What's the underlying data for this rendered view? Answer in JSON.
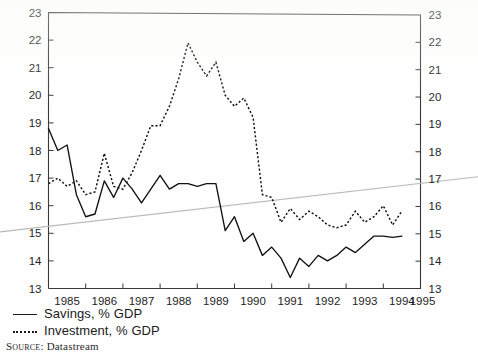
{
  "figure": {
    "kind": "scanned-line-chart",
    "background_color": "#fefefe",
    "ink_color": "#111111"
  },
  "legend": {
    "position": "below-axis-left",
    "items": [
      {
        "style": "solid",
        "label": "Savings, % GDP",
        "icon": "solid-line-swatch"
      },
      {
        "style": "dotted",
        "label": "Investment, % GDP",
        "icon": "dotted-line-swatch"
      }
    ]
  },
  "source": {
    "key": "Source:",
    "value": "Datastream"
  },
  "chart_data": {
    "type": "line",
    "title": "",
    "subtitle": "",
    "xlabel": "",
    "ylabel": "",
    "ylabel_right": "",
    "grid": false,
    "legend_position": "below",
    "xlim": [
      1985.0,
      1995.0
    ],
    "ylim": [
      13,
      23
    ],
    "yticks": [
      13,
      14,
      15,
      16,
      17,
      18,
      19,
      20,
      21,
      22,
      23
    ],
    "ytick_labels": [
      "13",
      "14",
      "15",
      "16",
      "17",
      "18",
      "19",
      "20",
      "21",
      "22",
      "23"
    ],
    "y_axis_both_sides": true,
    "xticks": [
      1985,
      1986,
      1987,
      1988,
      1989,
      1990,
      1991,
      1992,
      1993,
      1994,
      1995
    ],
    "xtick_labels": [
      "1985",
      "1986",
      "1987",
      "1988",
      "1989",
      "1990",
      "1991",
      "1992",
      "1993",
      "1994",
      "1995"
    ],
    "x_tick_label_placement": "between-ticks",
    "frequency": "quarterly",
    "x": [
      1985.0,
      1985.25,
      1985.5,
      1985.75,
      1986.0,
      1986.25,
      1986.5,
      1986.75,
      1987.0,
      1987.25,
      1987.5,
      1987.75,
      1988.0,
      1988.25,
      1988.5,
      1988.75,
      1989.0,
      1989.25,
      1989.5,
      1989.75,
      1990.0,
      1990.25,
      1990.5,
      1990.75,
      1991.0,
      1991.25,
      1991.5,
      1991.75,
      1992.0,
      1992.25,
      1992.5,
      1992.75,
      1993.0,
      1993.25,
      1993.5,
      1993.75,
      1994.0,
      1994.25,
      1994.5
    ],
    "series": [
      {
        "name": "Savings, % GDP",
        "style": "solid",
        "color": "#111111",
        "values": [
          18.8,
          18.0,
          18.2,
          16.4,
          15.6,
          15.7,
          16.9,
          16.3,
          17.0,
          16.6,
          16.1,
          16.6,
          17.1,
          16.6,
          16.8,
          16.8,
          16.7,
          16.8,
          16.8,
          15.1,
          15.6,
          14.7,
          15.0,
          14.2,
          14.5,
          14.1,
          13.4,
          14.1,
          13.8,
          14.2,
          14.0,
          14.2,
          14.5,
          14.3,
          14.6,
          14.9,
          14.9,
          14.85,
          14.9
        ]
      },
      {
        "name": "Investment, % GDP",
        "style": "dotted",
        "color": "#111111",
        "values": [
          16.8,
          17.0,
          16.7,
          16.9,
          16.4,
          16.5,
          17.9,
          16.7,
          16.6,
          17.2,
          18.0,
          18.9,
          18.9,
          19.6,
          20.6,
          21.9,
          21.2,
          20.7,
          21.2,
          20.0,
          19.6,
          19.9,
          19.2,
          16.4,
          16.3,
          15.4,
          15.9,
          15.5,
          15.8,
          15.6,
          15.3,
          15.2,
          15.3,
          15.8,
          15.4,
          15.6,
          16.0,
          15.3,
          15.8
        ]
      }
    ],
    "annotations": [
      {
        "kind": "page-fold-line",
        "color": "#b9b9b9",
        "from": [
          1985.0,
          15.05
        ],
        "to": [
          1995.0,
          17.05
        ]
      }
    ]
  }
}
